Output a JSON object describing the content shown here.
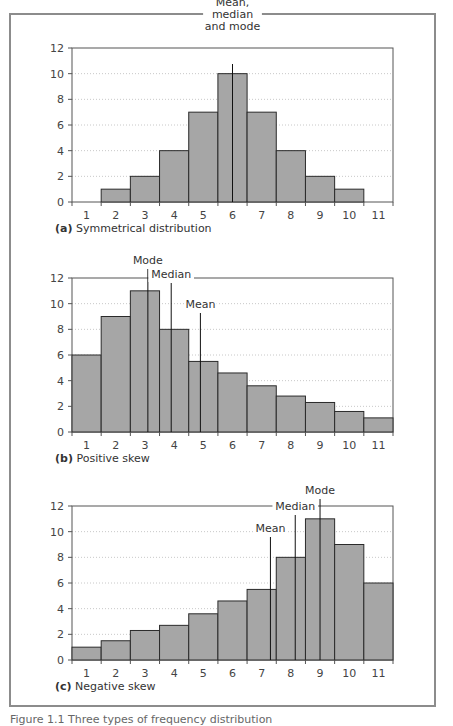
{
  "figure": {
    "caption_partial": "Figure 1.1 Three types of frequency distribution"
  },
  "chart_data": [
    {
      "id": "a",
      "type": "bar",
      "panel_label": "(a)",
      "title": "Symmetrical distribution",
      "categories": [
        "1",
        "2",
        "3",
        "4",
        "5",
        "6",
        "7",
        "8",
        "9",
        "10",
        "11"
      ],
      "values": [
        0,
        1,
        2,
        4,
        7,
        10,
        7,
        4,
        2,
        1,
        0
      ],
      "xlabel": "",
      "ylabel": "",
      "ylim": [
        0,
        12
      ],
      "yticks": [
        0,
        2,
        4,
        6,
        8,
        10,
        12
      ],
      "grid": "dotted horizontal",
      "bar_color": "#a6a6a6",
      "annotations": [
        {
          "label": "Mean, median and mode",
          "lines": [
            "Mean,",
            "median",
            "and mode"
          ],
          "x": 6.0
        }
      ]
    },
    {
      "id": "b",
      "type": "bar",
      "panel_label": "(b)",
      "title": "Positive skew",
      "categories": [
        "1",
        "2",
        "3",
        "4",
        "5",
        "6",
        "7",
        "8",
        "9",
        "10",
        "11"
      ],
      "values": [
        6,
        9,
        11,
        8,
        5.5,
        4.6,
        3.6,
        2.8,
        2.3,
        1.6,
        1.1
      ],
      "xlabel": "",
      "ylabel": "",
      "ylim": [
        0,
        12
      ],
      "yticks": [
        0,
        2,
        4,
        6,
        8,
        10,
        12
      ],
      "grid": "dotted horizontal",
      "bar_color": "#a6a6a6",
      "annotations": [
        {
          "label": "Mode",
          "lines": [
            "Mode"
          ],
          "x": 3.1
        },
        {
          "label": "Median",
          "lines": [
            "Median"
          ],
          "x": 3.9
        },
        {
          "label": "Mean",
          "lines": [
            "Mean"
          ],
          "x": 4.9
        }
      ]
    },
    {
      "id": "c",
      "type": "bar",
      "panel_label": "(c)",
      "title": "Negative skew",
      "categories": [
        "1",
        "2",
        "3",
        "4",
        "5",
        "6",
        "7",
        "8",
        "9",
        "10",
        "11"
      ],
      "values": [
        1,
        1.5,
        2.3,
        2.7,
        3.6,
        4.6,
        5.5,
        8,
        11,
        9,
        6
      ],
      "xlabel": "",
      "ylabel": "",
      "ylim": [
        0,
        12
      ],
      "yticks": [
        0,
        2,
        4,
        6,
        8,
        10,
        12
      ],
      "grid": "dotted horizontal",
      "bar_color": "#a6a6a6",
      "annotations": [
        {
          "label": "Mean",
          "lines": [
            "Mean"
          ],
          "x": 7.3
        },
        {
          "label": "Median",
          "lines": [
            "Median"
          ],
          "x": 8.15
        },
        {
          "label": "Mode",
          "lines": [
            "Mode"
          ],
          "x": 9.0
        }
      ]
    }
  ]
}
